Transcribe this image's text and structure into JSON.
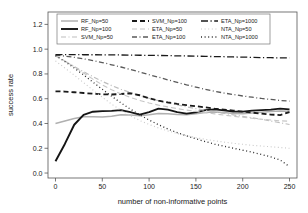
{
  "chart_data": {
    "type": "line",
    "title": "",
    "xlabel": "number of non-informative points",
    "ylabel": "success rate",
    "xlim": [
      -8,
      258
    ],
    "ylim": [
      -0.04,
      1.3
    ],
    "xticks": [
      0,
      50,
      100,
      150,
      200,
      250
    ],
    "xtick_labels": [
      "0",
      "50",
      "100",
      "150",
      "200",
      "250"
    ],
    "yticks": [
      0.0,
      0.2,
      0.4,
      0.6,
      0.8,
      1.0,
      1.2
    ],
    "ytick_labels": [
      "0.0",
      "0.2",
      "0.4",
      "0.6",
      "0.8",
      "1.0",
      "1.2"
    ],
    "grid": false,
    "legend_position": "top-center-inside",
    "legend_columns": 3,
    "x": [
      0,
      10,
      20,
      30,
      40,
      50,
      60,
      70,
      80,
      90,
      100,
      110,
      120,
      130,
      140,
      150,
      160,
      170,
      180,
      190,
      200,
      210,
      220,
      230,
      240,
      250
    ],
    "series": [
      {
        "name": "RF_Np=50",
        "color": "#b0b0b0",
        "dash": "none",
        "width": 1.5,
        "values": [
          0.4,
          0.42,
          0.44,
          0.455,
          0.455,
          0.452,
          0.458,
          0.47,
          0.468,
          0.462,
          0.47,
          0.48,
          0.478,
          0.472,
          0.47,
          0.478,
          0.488,
          0.492,
          0.488,
          0.48,
          0.478,
          0.484,
          0.49,
          0.496,
          0.5,
          0.498
        ]
      },
      {
        "name": "RF_Np=100",
        "color": "#151515",
        "dash": "none",
        "width": 1.9,
        "values": [
          0.095,
          0.235,
          0.39,
          0.47,
          0.495,
          0.5,
          0.502,
          0.508,
          0.492,
          0.472,
          0.492,
          0.52,
          0.512,
          0.492,
          0.48,
          0.49,
          0.508,
          0.514,
          0.506,
          0.496,
          0.496,
          0.504,
          0.508,
          0.512,
          0.52,
          0.514
        ]
      },
      {
        "name": "SVM_Np=50",
        "color": "#bdbdbd",
        "dash": "dashdot",
        "width": 1.2,
        "values": [
          0.945,
          0.905,
          0.86,
          0.818,
          0.778,
          0.74,
          0.706,
          0.676,
          0.65,
          0.626,
          0.604,
          0.584,
          0.566,
          0.55,
          0.534,
          0.52,
          0.506,
          0.494,
          0.482,
          0.47,
          0.458,
          0.446,
          0.434,
          0.42,
          0.406,
          0.392
        ]
      },
      {
        "name": "SVM_Np=100",
        "color": "#1a1a1a",
        "dash": "dashed",
        "width": 1.8,
        "values": [
          0.66,
          0.658,
          0.652,
          0.646,
          0.64,
          0.636,
          0.634,
          0.638,
          0.644,
          0.628,
          0.604,
          0.584,
          0.57,
          0.558,
          0.548,
          0.54,
          0.53,
          0.52,
          0.512,
          0.504,
          0.496,
          0.488,
          0.48,
          0.472,
          0.468,
          0.492
        ]
      },
      {
        "name": "ETA_Np=50",
        "color": "#c6c6c6",
        "dash": "dashed",
        "width": 1.1,
        "values": [
          0.95,
          0.905,
          0.858,
          0.808,
          0.758,
          0.712,
          0.672,
          0.638,
          0.61,
          0.586,
          0.566,
          0.548,
          0.534,
          0.52,
          0.508,
          0.498,
          0.488,
          0.478,
          0.468,
          0.458,
          0.45,
          0.442,
          0.434,
          0.428,
          0.422,
          0.418
        ]
      },
      {
        "name": "ETA_Np=100",
        "color": "#5a5a5a",
        "dash": "dashdot",
        "width": 1.3,
        "values": [
          0.952,
          0.944,
          0.934,
          0.922,
          0.908,
          0.892,
          0.874,
          0.856,
          0.836,
          0.816,
          0.794,
          0.774,
          0.752,
          0.732,
          0.712,
          0.694,
          0.676,
          0.66,
          0.646,
          0.634,
          0.622,
          0.612,
          0.602,
          0.594,
          0.586,
          0.58
        ]
      },
      {
        "name": "ETA_Np=1000",
        "color": "#1a1a1a",
        "dash": "longdashdot",
        "width": 1.3,
        "values": [
          0.956,
          0.956,
          0.956,
          0.955,
          0.955,
          0.954,
          0.954,
          0.953,
          0.952,
          0.951,
          0.95,
          0.949,
          0.948,
          0.946,
          0.945,
          0.944,
          0.942,
          0.94,
          0.939,
          0.937,
          0.936,
          0.934,
          0.932,
          0.931,
          0.93,
          0.929
        ]
      },
      {
        "name": "NTA_Np=50",
        "color": "#c9c9c9",
        "dash": "dotted",
        "width": 1.1,
        "values": [
          0.905,
          0.848,
          0.79,
          0.73,
          0.67,
          0.612,
          0.556,
          0.506,
          0.462,
          0.424,
          0.392,
          0.364,
          0.34,
          0.32,
          0.302,
          0.286,
          0.272,
          0.26,
          0.25,
          0.24,
          0.232,
          0.224,
          0.218,
          0.212,
          0.206,
          0.2
        ]
      },
      {
        "name": "NTA_Np=1000",
        "color": "#2a2a2a",
        "dash": "dotted",
        "width": 1.3,
        "values": [
          0.948,
          0.9,
          0.848,
          0.792,
          0.734,
          0.676,
          0.62,
          0.566,
          0.516,
          0.47,
          0.428,
          0.39,
          0.356,
          0.326,
          0.3,
          0.276,
          0.254,
          0.234,
          0.216,
          0.2,
          0.184,
          0.168,
          0.15,
          0.13,
          0.105,
          0.052
        ]
      }
    ],
    "legend_entries": [
      {
        "label": "RF_Np=50",
        "column": 1,
        "row": 1
      },
      {
        "label": "RF_Np=100",
        "column": 1,
        "row": 2
      },
      {
        "label": "SVM_Np=50",
        "column": 1,
        "row": 3
      },
      {
        "label": "SVM_Np=100",
        "column": 2,
        "row": 1
      },
      {
        "label": "ETA_Np=50",
        "column": 2,
        "row": 2
      },
      {
        "label": "ETA_Np=100",
        "column": 2,
        "row": 3
      },
      {
        "label": "ETA_Np=1000",
        "column": 3,
        "row": 1
      },
      {
        "label": "NTA_Np=50",
        "column": 3,
        "row": 2
      },
      {
        "label": "NTA_Np=1000",
        "column": 3,
        "row": 3
      }
    ]
  }
}
